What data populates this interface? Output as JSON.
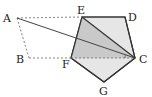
{
  "diagram": {
    "title": "",
    "type": "geometry",
    "colors": {
      "background": "#ffffff",
      "stroke": "#333333",
      "dashed": "#777777",
      "pentagon_fill": "#e4e4e4",
      "triangle_fill": "#c8c8c8"
    },
    "points": {
      "A": {
        "label": "A",
        "x": 17,
        "y": 18
      },
      "B": {
        "label": "B",
        "x": 29,
        "y": 58
      },
      "C": {
        "label": "C",
        "x": 135,
        "y": 58
      },
      "D": {
        "label": "D",
        "x": 125,
        "y": 17
      },
      "E": {
        "label": "E",
        "x": 82,
        "y": 17
      },
      "F": {
        "label": "F",
        "x": 71,
        "y": 58
      },
      "G": {
        "label": "G",
        "x": 104,
        "y": 82
      }
    },
    "labels": [
      {
        "text": "A",
        "x": 3,
        "y": 22
      },
      {
        "text": "B",
        "x": 16,
        "y": 63
      },
      {
        "text": "C",
        "x": 139,
        "y": 63
      },
      {
        "text": "D",
        "x": 128,
        "y": 20
      },
      {
        "text": "E",
        "x": 77,
        "y": 14
      },
      {
        "text": "F",
        "x": 62,
        "y": 67
      },
      {
        "text": "G",
        "x": 99,
        "y": 95
      }
    ],
    "shapes": {
      "pentagon": "EDCGF (regular pentagon, filled light gray)",
      "triangle": "ECF (shaded darker gray)",
      "parallelogram": "ABFE / A-E dashed, A-B dashed, B-F dashed (ABCE dashed top/bottom)",
      "segment_AC": "solid line from A to C",
      "angle_mark": "small arc at C between CF and CA"
    }
  }
}
